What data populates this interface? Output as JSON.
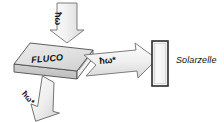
{
  "figure": {
    "type": "schematic-diagram",
    "background_color": "#ffffff",
    "title_text": ""
  },
  "labels": {
    "incident_photon": "ħω",
    "emitted_photon_right": "ħω*",
    "emitted_photon_down": "ħω*",
    "slab": "FLUCO",
    "solar_cell": "Solarzelle"
  },
  "shapes": {
    "slab": {
      "name": "FLUCO",
      "kind": "3d-plate",
      "top_face_color": "#e2e2e2",
      "front_face_color": "#c9c9c9",
      "side_face_color": "#efefef",
      "outline_color": "#4a4a4a"
    },
    "solar_cell": {
      "name": "Solarzelle",
      "kind": "rectangle",
      "fill_color": "#f4f4f4",
      "outline_color": "#2b2b2b"
    },
    "arrows": [
      {
        "name": "arrow-incident",
        "direction": "down",
        "label": "ħω",
        "fill_color": "#ededed",
        "outline_color": "#6e6e6e"
      },
      {
        "name": "arrow-emitted-right",
        "direction": "right",
        "label": "ħω*",
        "fill_color": "#ededed",
        "outline_color": "#6e6e6e"
      },
      {
        "name": "arrow-emitted-down-left",
        "direction": "down-left",
        "label": "ħω*",
        "fill_color": "#ededed",
        "outline_color": "#6e6e6e"
      }
    ]
  },
  "colors": {
    "outline": "#6e6e6e",
    "dark_outline": "#2b2b2b",
    "gray_fill": "#e4e4e4",
    "light_fill": "#f6f6f6",
    "text": "#111111"
  }
}
